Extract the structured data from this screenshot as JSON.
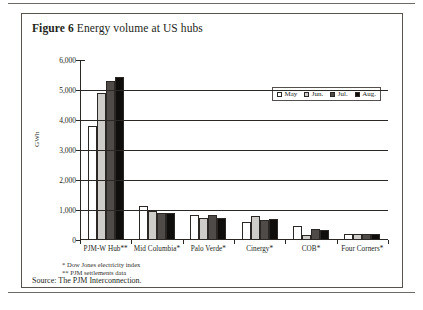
{
  "figure": {
    "label": "Figure 6",
    "title": "Energy volume at US hubs"
  },
  "footnotes": [
    "*  Dow Jones electricity index",
    "** PJM settlements data"
  ],
  "source": "Source: The PJM Interconnection.",
  "legend": {
    "position": "inside-top-right",
    "entries": [
      "May",
      "Jun.",
      "Jul.",
      "Aug."
    ]
  },
  "colors": {
    "may": "#ffffff",
    "jun": "#cfcdc9",
    "jul": "#4f4b48",
    "aug": "#100e0d",
    "axis": "#2b2724",
    "frame": "#58534f"
  },
  "chart_data": {
    "type": "bar",
    "title": "Energy volume at US hubs",
    "xlabel": "",
    "ylabel": "GWh",
    "ylim": [
      0,
      6000
    ],
    "yticks": [
      "0",
      "1,000",
      "2,000",
      "3,000",
      "4,000",
      "5,000",
      "6,000"
    ],
    "ytick_values": [
      0,
      1000,
      2000,
      3000,
      4000,
      5000,
      6000
    ],
    "grid": true,
    "categories": [
      "PJM-W Hub**",
      "Mid Columbia*",
      "Palo Verde*",
      "Cinergy*",
      "COB*",
      "Four Corners*"
    ],
    "series": [
      {
        "name": "May",
        "values": [
          3800,
          1120,
          850,
          600,
          480,
          200
        ]
      },
      {
        "name": "Jun.",
        "values": [
          4900,
          960,
          740,
          790,
          180,
          190
        ]
      },
      {
        "name": "Jul.",
        "values": [
          5300,
          900,
          820,
          680,
          360,
          200
        ]
      },
      {
        "name": "Aug.",
        "values": [
          5430,
          900,
          720,
          700,
          320,
          195
        ]
      }
    ]
  }
}
